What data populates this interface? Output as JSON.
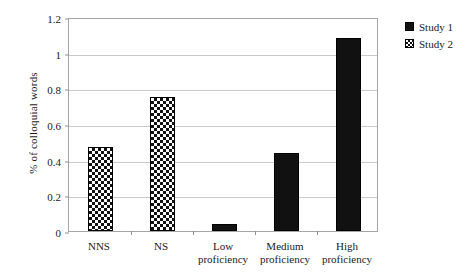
{
  "chart_data": {
    "type": "bar",
    "title": "",
    "xlabel": "",
    "ylabel": "% of colloquial words",
    "categories": [
      "NNS",
      "NS",
      "Low proficiency",
      "Medium proficiency",
      "High proficiency"
    ],
    "category_lines": [
      [
        "NNS"
      ],
      [
        "NS"
      ],
      [
        "Low",
        "proficiency"
      ],
      [
        "Medium",
        "proficiency"
      ],
      [
        "High",
        "proficiency"
      ]
    ],
    "values": [
      0.47,
      0.75,
      0.04,
      0.44,
      1.08
    ],
    "point_series": [
      "Study 2",
      "Study 2",
      "Study 1",
      "Study 1",
      "Study 1"
    ],
    "ylim": [
      0,
      1.2
    ],
    "yticks": [
      0,
      0.2,
      0.4,
      0.6,
      0.8,
      1,
      1.2
    ],
    "ytick_labels": [
      "0",
      "0.2",
      "0.4",
      "0.6",
      "0.8",
      "1",
      "1.2"
    ],
    "grid": "horizontal",
    "legend_position": "top-right",
    "series": [
      {
        "name": "Study 1",
        "fill": "solid",
        "color": "#111111"
      },
      {
        "name": "Study 2",
        "fill": "checker",
        "color": "#111111"
      }
    ]
  },
  "legend": {
    "items": [
      {
        "label": "Study 1",
        "fill": "solid"
      },
      {
        "label": "Study 2",
        "fill": "checker"
      }
    ]
  }
}
